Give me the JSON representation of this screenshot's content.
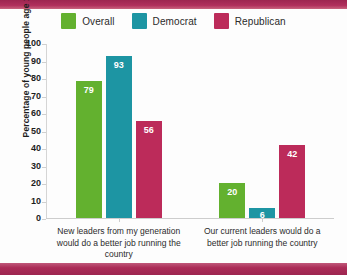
{
  "colors": {
    "overall": "#63b12f",
    "democrat": "#1d95a3",
    "republican": "#bc2b5a",
    "band": "#a82a55",
    "axis": "#cfcfcf",
    "text": "#2b2b2b"
  },
  "legend": {
    "items": [
      {
        "label": "Overall",
        "color": "#63b12f",
        "icon": "legend-swatch"
      },
      {
        "label": "Democrat",
        "color": "#1d95a3",
        "icon": "legend-swatch"
      },
      {
        "label": "Republican",
        "color": "#bc2b5a",
        "icon": "legend-swatch"
      }
    ]
  },
  "chart_data": {
    "type": "bar",
    "title": "",
    "xlabel": "",
    "ylabel": "Percentage of young people age 15 to 34",
    "ylim": [
      0,
      100
    ],
    "yticks": [
      0,
      10,
      20,
      30,
      40,
      50,
      60,
      70,
      80,
      90,
      100
    ],
    "grid": false,
    "legend_position": "top-center",
    "categories": [
      "New leaders from my generation would do a better job running the country",
      "Our current leaders would do a better job running the country"
    ],
    "series": [
      {
        "name": "Overall",
        "color": "#63b12f",
        "values": [
          79,
          20
        ]
      },
      {
        "name": "Democrat",
        "color": "#1d95a3",
        "values": [
          93,
          6
        ]
      },
      {
        "name": "Republican",
        "color": "#bc2b5a",
        "values": [
          56,
          42
        ]
      }
    ]
  }
}
